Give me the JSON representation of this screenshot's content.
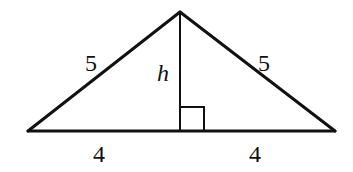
{
  "diagram": {
    "type": "isosceles-triangle-with-altitude",
    "vertices": {
      "apex": [
        180,
        12
      ],
      "left": [
        28,
        131
      ],
      "right": [
        335,
        131
      ]
    },
    "altitude_foot": [
      180,
      131
    ],
    "right_angle_marker": {
      "x": 181,
      "y": 107,
      "size": 23
    },
    "labels": {
      "left_side": "5",
      "right_side": "5",
      "height": "h",
      "left_base": "4",
      "right_base": "4"
    },
    "colors": {
      "stroke": "#111111",
      "background": "#ffffff"
    }
  }
}
